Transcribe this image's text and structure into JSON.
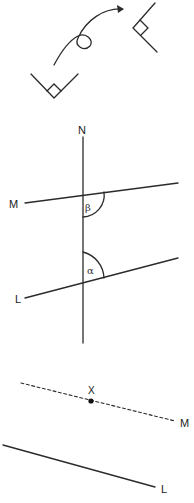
{
  "panels": {
    "rotation": {
      "description": "Right angle rotated via curved arrow",
      "source_angle": {
        "vertex": [
          54,
          98
        ],
        "arm_a_end": [
          31,
          74
        ],
        "arm_b_end": [
          78,
          74
        ]
      },
      "target_angle": {
        "vertex": [
          133,
          28
        ],
        "arm_a_end": [
          155,
          3
        ],
        "arm_b_end": [
          157,
          52
        ]
      }
    },
    "transversal": {
      "labels": {
        "N": "N",
        "M": "M",
        "L": "L",
        "beta": "β",
        "alpha": "α"
      },
      "line_N": {
        "x1": 83,
        "y1": 137,
        "x2": 83,
        "y2": 343
      },
      "line_M": {
        "x1": 25,
        "y1": 203,
        "x2": 178,
        "y2": 183
      },
      "line_L": {
        "x1": 25,
        "y1": 298,
        "x2": 178,
        "y2": 258
      }
    },
    "parallel": {
      "labels": {
        "X": "X",
        "M": "M",
        "L": "L"
      },
      "dashed_M": {
        "x1": 21,
        "y1": 383,
        "x2": 175,
        "y2": 421
      },
      "point_X": [
        91,
        401
      ],
      "solid_L": {
        "x1": 3,
        "y1": 445,
        "x2": 155,
        "y2": 487
      }
    }
  },
  "colors": {
    "line": "#2b2b2b",
    "background": "#ffffff"
  }
}
